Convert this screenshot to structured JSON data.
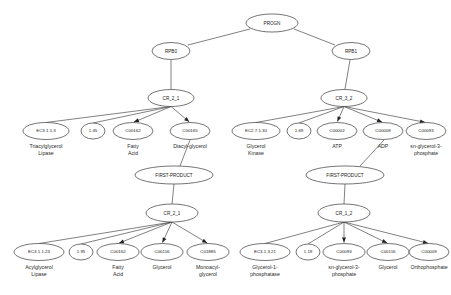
{
  "diagram": {
    "background_color": "#ffffff",
    "node_fill": "#ffffff",
    "node_stroke": "#3a3a3a",
    "edge_color": "#4a4a4a",
    "text_color": "#1a1a1a"
  },
  "nodes": {
    "root": {
      "label": "PROGN",
      "cx": 272,
      "cy": 23,
      "rx": 26,
      "ry": 9,
      "font_size": 4.6
    },
    "rpb0": {
      "label": "RPB0",
      "cx": 171,
      "cy": 51,
      "rx": 19,
      "ry": 8.5,
      "font_size": 4.6
    },
    "rpb1": {
      "label": "RPB1",
      "cx": 351,
      "cy": 51,
      "rx": 19,
      "ry": 8.5,
      "font_size": 4.6
    },
    "cr_2_1_top": {
      "label": "CR_2_1",
      "cx": 171,
      "cy": 98,
      "rx": 23,
      "ry": 8.5,
      "font_size": 4.6
    },
    "cr_3_2_top": {
      "label": "CR_3_2",
      "cx": 344,
      "cy": 98,
      "rx": 23,
      "ry": 8.5,
      "font_size": 4.6
    },
    "fp_left": {
      "label": "FIRST-PRODUCT",
      "cx": 174,
      "cy": 175,
      "rx": 39,
      "ry": 9,
      "font_size": 4.6
    },
    "fp_right": {
      "label": "FIRST-PRODUCT",
      "cx": 345,
      "cy": 175,
      "rx": 39,
      "ry": 9,
      "font_size": 4.6
    },
    "cr_2_1_bot": {
      "label": "CR_2_1",
      "cx": 172,
      "cy": 213,
      "rx": 26,
      "ry": 9,
      "font_size": 4.6
    },
    "cr_1_2_bot": {
      "label": "CR_1_2",
      "cx": 344,
      "cy": 213,
      "rx": 26,
      "ry": 9,
      "font_size": 4.6
    }
  },
  "clusters": [
    {
      "name": "triacylglycerol-lipase-cluster",
      "parent": "cr_2_1_top",
      "leaves": [
        {
          "id": "ec-3-1-1-3",
          "label": "EC3.1.1.3",
          "cx": 46,
          "cy": 131,
          "rx": 23,
          "ry": 8.5,
          "font_size": 4.4,
          "caption": [
            "Triacylglycerol",
            "Lipase"
          ],
          "arrow": false
        },
        {
          "id": "n-1-45",
          "label": "1.45",
          "cx": 93,
          "cy": 131,
          "rx": 12,
          "ry": 8,
          "font_size": 4.4,
          "caption": [],
          "arrow": false
        },
        {
          "id": "c00162-a",
          "label": "C00162",
          "cx": 133,
          "cy": 131,
          "rx": 20,
          "ry": 8.5,
          "font_size": 4.4,
          "caption": [
            "Fatty",
            "Acid"
          ],
          "arrow": true
        },
        {
          "id": "c00165",
          "label": "C00165",
          "cx": 190,
          "cy": 131,
          "rx": 20,
          "ry": 8.5,
          "font_size": 4.4,
          "caption": [
            "Diacyl-glycerol"
          ],
          "arrow": true
        }
      ]
    },
    {
      "name": "glycerol-kinase-cluster",
      "parent": "cr_3_2_top",
      "leaves": [
        {
          "id": "ec-2-7-1-30",
          "label": "EC2.7.1.30",
          "cx": 256,
          "cy": 131,
          "rx": 24,
          "ry": 8.5,
          "font_size": 4.4,
          "caption": [
            "Glycerol",
            "Kinase"
          ],
          "arrow": false
        },
        {
          "id": "n-1-69",
          "label": "1.69",
          "cx": 299,
          "cy": 131,
          "rx": 12,
          "ry": 8,
          "font_size": 4.4,
          "caption": [],
          "arrow": false
        },
        {
          "id": "c00002",
          "label": "C00002",
          "cx": 337,
          "cy": 131,
          "rx": 20,
          "ry": 8.5,
          "font_size": 4.4,
          "caption": [
            "ATP"
          ],
          "arrow": true
        },
        {
          "id": "c00008",
          "label": "C00008",
          "cx": 383,
          "cy": 131,
          "rx": 20,
          "ry": 8.5,
          "font_size": 4.4,
          "caption": [
            "ADP"
          ],
          "arrow": true
        },
        {
          "id": "c00093-a",
          "label": "C00093",
          "cx": 426,
          "cy": 131,
          "rx": 20,
          "ry": 8.5,
          "font_size": 4.4,
          "caption": [
            "sn-glycerol-3-",
            "phosphate"
          ],
          "arrow": true
        }
      ]
    },
    {
      "name": "acylglycerol-lipase-cluster",
      "parent": "cr_2_1_bot",
      "leaves": [
        {
          "id": "ec-3-1-1-23",
          "label": "EC3.1.1.23",
          "cx": 39,
          "cy": 252,
          "rx": 25,
          "ry": 8.5,
          "font_size": 4.4,
          "caption": [
            "Acylglycerol",
            "Lipase"
          ],
          "arrow": false
        },
        {
          "id": "n-1-95",
          "label": "1.95",
          "cx": 81,
          "cy": 252,
          "rx": 12,
          "ry": 8,
          "font_size": 4.4,
          "caption": [],
          "arrow": false
        },
        {
          "id": "c00162-b",
          "label": "C00162",
          "cx": 118,
          "cy": 252,
          "rx": 21,
          "ry": 8.5,
          "font_size": 4.4,
          "caption": [
            "Fatty",
            "Acid"
          ],
          "arrow": true
        },
        {
          "id": "c00116-a",
          "label": "C00116",
          "cx": 162,
          "cy": 252,
          "rx": 21,
          "ry": 8.5,
          "font_size": 4.4,
          "caption": [
            "Glycerol"
          ],
          "arrow": true
        },
        {
          "id": "c01885",
          "label": "C01885",
          "cx": 208,
          "cy": 252,
          "rx": 21,
          "ry": 8.5,
          "font_size": 4.4,
          "caption": [
            "Monoacyl-",
            "glycerol"
          ],
          "arrow": true
        }
      ]
    },
    {
      "name": "glycerol-1-phosphatase-cluster",
      "parent": "cr_1_2_bot",
      "leaves": [
        {
          "id": "ec-3-1-3-21",
          "label": "EC3.1.3.21",
          "cx": 265,
          "cy": 252,
          "rx": 25,
          "ry": 8.5,
          "font_size": 4.4,
          "caption": [
            "Glycerol-1-",
            "phosphatase"
          ],
          "arrow": false
        },
        {
          "id": "n-1-19",
          "label": "1.19",
          "cx": 308,
          "cy": 252,
          "rx": 12,
          "ry": 8,
          "font_size": 4.4,
          "caption": [],
          "arrow": false
        },
        {
          "id": "c00093-b",
          "label": "C00093",
          "cx": 344,
          "cy": 252,
          "rx": 21,
          "ry": 8.5,
          "font_size": 4.4,
          "caption": [
            "sn-glycerol-3-",
            "phosphate"
          ],
          "arrow": true
        },
        {
          "id": "c00116-b",
          "label": "C00116",
          "cx": 388,
          "cy": 252,
          "rx": 21,
          "ry": 8.5,
          "font_size": 4.4,
          "caption": [
            "Glycerol"
          ],
          "arrow": true
        },
        {
          "id": "c00009",
          "label": "C00009",
          "cx": 429,
          "cy": 252,
          "rx": 20,
          "ry": 8.5,
          "font_size": 4.4,
          "caption": [
            "Orthophosphate"
          ],
          "arrow": true
        }
      ]
    }
  ],
  "trunk_edges": [
    {
      "name": "progn-to-rpb0",
      "x1": 250,
      "y1": 29,
      "x2": 188,
      "y2": 45
    },
    {
      "name": "progn-to-rpb1",
      "x1": 294,
      "y1": 29,
      "x2": 335,
      "y2": 45
    },
    {
      "name": "rpb0-to-cr21",
      "x1": 171,
      "y1": 60,
      "x2": 171,
      "y2": 89
    },
    {
      "name": "rpb1-to-cr32",
      "x1": 350,
      "y1": 60,
      "x2": 345,
      "y2": 89
    },
    {
      "name": "c00165-to-fp",
      "x1": 190,
      "y1": 140,
      "x2": 180,
      "y2": 166
    },
    {
      "name": "c00093-to-fp",
      "x1": 384,
      "y1": 140,
      "x2": 360,
      "y2": 166
    },
    {
      "name": "fpleft-to-cr21",
      "x1": 174,
      "y1": 184,
      "x2": 172,
      "y2": 204
    },
    {
      "name": "fpright-to-cr12",
      "x1": 345,
      "y1": 184,
      "x2": 344,
      "y2": 204
    }
  ],
  "caption_font_size": 5.2,
  "caption_line_height": 7
}
